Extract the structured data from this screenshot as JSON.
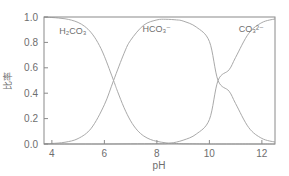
{
  "chart_data": {
    "type": "line",
    "title": "",
    "subtitle": "",
    "xlabel": "pH",
    "ylabel": "比率",
    "xlim": [
      3.7,
      12.5
    ],
    "ylim": [
      0.0,
      1.0
    ],
    "xticks": [
      "4",
      "6",
      "8",
      "10",
      "12"
    ],
    "xtick_values": [
      4,
      6,
      8,
      10,
      12
    ],
    "yticks": [
      "0.0",
      "0.2",
      "0.4",
      "0.6",
      "0.8",
      "1.0"
    ],
    "ytick_values": [
      0.0,
      0.2,
      0.4,
      0.6,
      0.8,
      1.0
    ],
    "grid": false,
    "legend_position": "inline-annotations",
    "pka1": 6.35,
    "pka2": 10.33,
    "annotations": [
      {
        "text": "H₂CO₃",
        "label_id": "h2co3",
        "x": 4.8,
        "y": 0.87
      },
      {
        "text": "HCO₃⁻",
        "label_id": "hco3",
        "x": 8.0,
        "y": 0.88
      },
      {
        "text": "CO₃²⁻",
        "label_id": "co3",
        "x": 11.6,
        "y": 0.88
      }
    ],
    "series": [
      {
        "name": "H₂CO₃",
        "x": [
          3.7,
          4.0,
          4.25,
          4.5,
          4.75,
          5.0,
          5.25,
          5.5,
          5.75,
          6.0,
          6.35,
          6.5,
          6.75,
          7.0,
          7.25,
          7.5,
          7.75,
          8.0,
          8.35,
          8.75,
          9.0,
          9.5,
          10.0,
          10.33,
          11.0,
          11.5,
          12.0,
          12.5
        ],
        "values": [
          0.998,
          0.996,
          0.992,
          0.986,
          0.975,
          0.957,
          0.926,
          0.876,
          0.799,
          0.691,
          0.5,
          0.415,
          0.286,
          0.182,
          0.109,
          0.063,
          0.036,
          0.021,
          0.009,
          0.004,
          0.002,
          0.001,
          0.0,
          0.0,
          0.0,
          0.0,
          0.0,
          0.0
        ]
      },
      {
        "name": "HCO₃⁻",
        "x": [
          3.7,
          4.0,
          4.5,
          5.0,
          5.5,
          6.0,
          6.35,
          6.75,
          7.0,
          7.5,
          8.0,
          8.34,
          8.75,
          9.0,
          9.5,
          10.0,
          10.33,
          10.75,
          11.0,
          11.5,
          12.0,
          12.5
        ],
        "values": [
          0.002,
          0.004,
          0.014,
          0.043,
          0.124,
          0.309,
          0.5,
          0.714,
          0.817,
          0.936,
          0.977,
          0.982,
          0.977,
          0.968,
          0.921,
          0.808,
          0.5,
          0.416,
          0.318,
          0.129,
          0.044,
          0.015
        ]
      },
      {
        "name": "CO₃²⁻",
        "x": [
          3.7,
          5.0,
          6.0,
          7.0,
          8.0,
          8.5,
          9.0,
          9.5,
          10.0,
          10.33,
          10.75,
          11.0,
          11.5,
          12.0,
          12.5
        ],
        "values": [
          0.0,
          0.0,
          0.0,
          0.001,
          0.002,
          0.006,
          0.03,
          0.078,
          0.192,
          0.5,
          0.584,
          0.682,
          0.871,
          0.956,
          0.985
        ]
      }
    ]
  }
}
